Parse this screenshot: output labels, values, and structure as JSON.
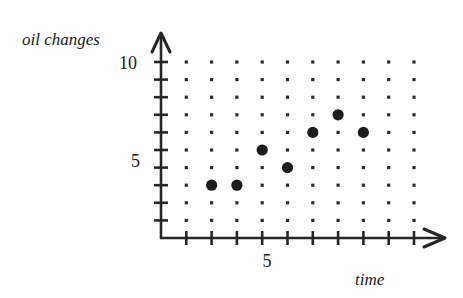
{
  "chart_data": {
    "type": "scatter",
    "title": "",
    "xlabel": "time",
    "ylabel": "oil changes",
    "x": [
      2,
      3,
      4,
      5,
      6,
      7,
      8
    ],
    "y": [
      3,
      3,
      5,
      4,
      6,
      7,
      6
    ],
    "points": [
      {
        "x": 2,
        "y": 3
      },
      {
        "x": 3,
        "y": 3
      },
      {
        "x": 4,
        "y": 5
      },
      {
        "x": 5,
        "y": 4
      },
      {
        "x": 6,
        "y": 6
      },
      {
        "x": 7,
        "y": 7
      },
      {
        "x": 8,
        "y": 6
      }
    ],
    "xlim": [
      0,
      10
    ],
    "ylim": [
      0,
      10
    ],
    "x_ticks": [
      1,
      2,
      3,
      4,
      5,
      6,
      7,
      8,
      9,
      10
    ],
    "y_ticks": [
      1,
      2,
      3,
      4,
      5,
      6,
      7,
      8,
      9,
      10
    ],
    "x_tick_labels": [
      {
        "value": 5,
        "label": "5"
      }
    ],
    "y_tick_labels": [
      {
        "value": 5,
        "label": "5"
      },
      {
        "value": 10,
        "label": "10"
      }
    ],
    "grid": "dot-lattice",
    "grid_columns": 10,
    "grid_rows": 10,
    "legend": "none",
    "point_color": "#1c1c1c",
    "axis_color": "#262626",
    "grid_dot_color": "#2b2b2b",
    "background_color": "#ffffff"
  },
  "labels": {
    "y_axis_title": "oil changes",
    "x_axis_title": "time",
    "y_tick_10": "10",
    "y_tick_5": "5",
    "x_tick_5": "5"
  }
}
